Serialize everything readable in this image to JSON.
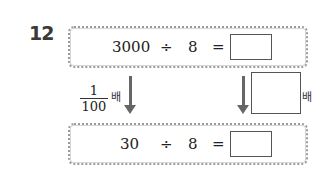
{
  "problem_number": "12",
  "top_equation": {
    "dividend": "3000",
    "operator": "÷",
    "divisor": "8",
    "equals": "=",
    "answer": ""
  },
  "bottom_equation": {
    "dividend": "30",
    "operator": "÷",
    "divisor": "8",
    "equals": "=",
    "answer": ""
  },
  "left_multiplier": {
    "numerator": "1",
    "denominator": "100",
    "suffix": "배"
  },
  "right_multiplier": {
    "answer": "",
    "suffix": "배"
  }
}
